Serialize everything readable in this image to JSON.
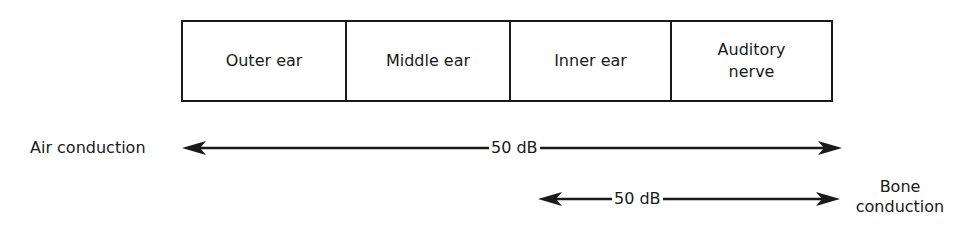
{
  "diagram": {
    "segments": [
      {
        "label": "Outer ear"
      },
      {
        "label": "Middle ear"
      },
      {
        "label": "Inner ear"
      },
      {
        "label": "Auditory nerve"
      }
    ],
    "air_conduction": {
      "label": "Air conduction",
      "value": "50 dB"
    },
    "bone_conduction": {
      "label_line1": "Bone",
      "label_line2": "conduction",
      "value": "50 dB"
    },
    "colors": {
      "line": "#1a1a1a",
      "background": "#ffffff"
    }
  }
}
